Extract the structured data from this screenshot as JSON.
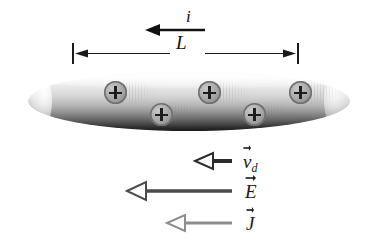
{
  "figure": {
    "background_color": "#ffffff",
    "width": 369,
    "height": 252
  },
  "current": {
    "label": "i",
    "arrow_name": "current-direction-arrow",
    "direction": "left",
    "arrow_style": "solid-filled",
    "color": "#111111",
    "x_start": 205,
    "x_end": 146,
    "y": 30
  },
  "dimension": {
    "label": "L",
    "name": "length-dimension-line",
    "color": "#1a1a1a",
    "x_left": 73,
    "x_right": 298,
    "y": 53
  },
  "conductor": {
    "name": "conductor-cylinder",
    "shape": "cylinder",
    "x": 28,
    "y": 71,
    "width": 322,
    "height": 60,
    "top_color": "#ffffff",
    "bottom_color": "#1b1b1b"
  },
  "charges": {
    "symbol": "+",
    "sign": "positive",
    "fill_color": "#a8a8a8",
    "glyph_color": "#1d1d1d",
    "count": 5,
    "items": [
      {
        "name": "charge-carrier-1",
        "x": 76,
        "y": 81
      },
      {
        "name": "charge-carrier-2",
        "x": 122,
        "y": 103
      },
      {
        "name": "charge-carrier-3",
        "x": 170,
        "y": 81
      },
      {
        "name": "charge-carrier-4",
        "x": 215,
        "y": 103
      },
      {
        "name": "charge-carrier-5",
        "x": 261,
        "y": 81
      }
    ]
  },
  "vectors": [
    {
      "name": "drift-velocity-vector",
      "base": "v",
      "subscript": "d",
      "label_text": "v",
      "color": "#2b2b2b",
      "arrow_style": "hollow",
      "direction": "left",
      "x_tail": 232,
      "x_head": 196,
      "y": 161,
      "label_x": 243,
      "label_y": 152
    },
    {
      "name": "electric-field-vector",
      "base": "E",
      "subscript": "",
      "label_text": "E",
      "color": "#4a4a4a",
      "arrow_style": "hollow",
      "direction": "left",
      "x_tail": 232,
      "x_head": 128,
      "y": 191,
      "label_x": 245,
      "label_y": 182
    },
    {
      "name": "current-density-vector",
      "base": "J",
      "subscript": "",
      "label_text": "J",
      "color": "#8d8d8d",
      "arrow_style": "hollow",
      "direction": "left",
      "x_tail": 232,
      "x_head": 168,
      "y": 223,
      "label_x": 246,
      "label_y": 214
    }
  ]
}
